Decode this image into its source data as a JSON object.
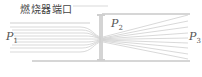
{
  "diagram": {
    "title": "燃烧器端口",
    "labels": {
      "p1": {
        "base": "P",
        "sub": "1"
      },
      "p2": {
        "base": "P",
        "sub": "2"
      },
      "p3": {
        "base": "P",
        "sub": "3"
      }
    },
    "colors": {
      "lines": "#cfcfcf",
      "wall": "#c8c8c8",
      "text": "#555555"
    }
  }
}
